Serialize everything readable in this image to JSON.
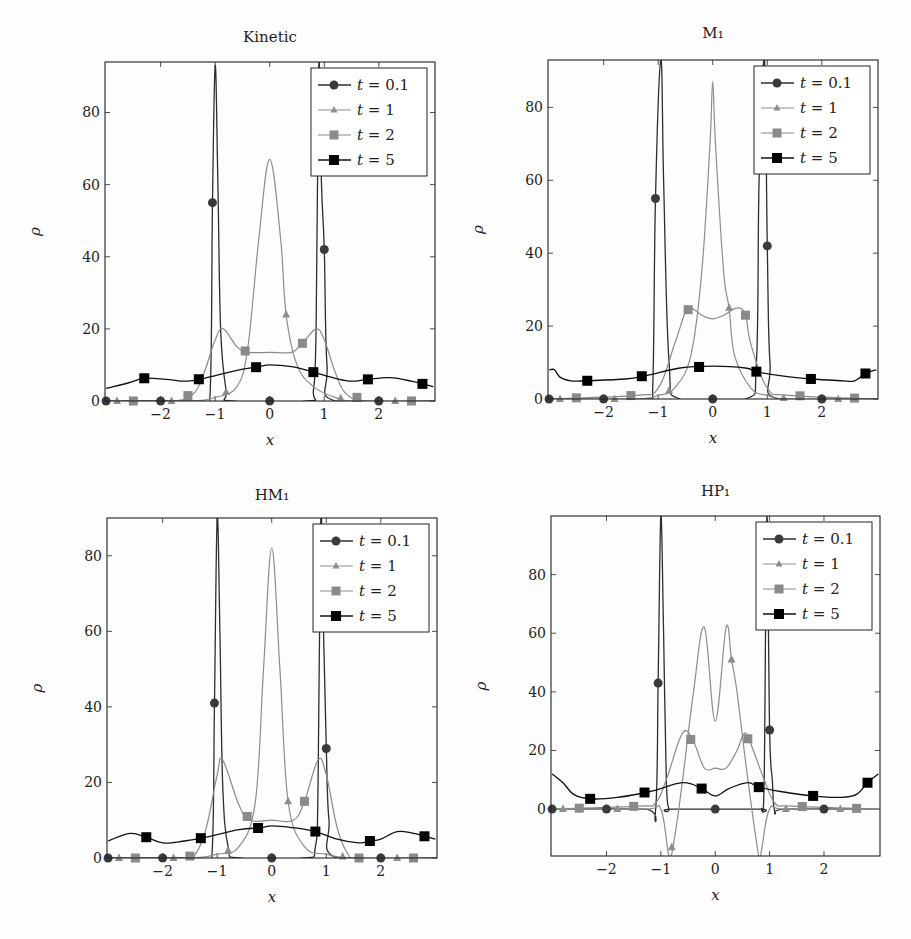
{
  "legend": [
    "t = 0.1",
    "t = 1",
    "t = 2",
    "t = 5"
  ],
  "colors": {
    "t0_1": "#333333",
    "t1": "#8a8a8a",
    "t2": "#888888",
    "t5": "#111111",
    "axis": "#222222"
  },
  "chart_data": [
    {
      "type": "line",
      "title": "Kinetic",
      "xlabel": "x",
      "ylabel": "ρ",
      "xlim": [
        -3,
        3
      ],
      "ylim": [
        0,
        94
      ],
      "xticks": [
        -2,
        -1,
        0,
        1,
        2
      ],
      "yticks": [
        0,
        20,
        40,
        60,
        80
      ],
      "legend_position": "upper right",
      "series": [
        {
          "name": "t = 0.1",
          "marker": "circle",
          "x": [
            -3,
            -1.3,
            -1.1,
            -1.05,
            -1.0,
            -0.95,
            -0.9,
            -0.8,
            -0.7,
            0.7,
            0.8,
            0.85,
            0.9,
            0.95,
            1.0,
            1.05,
            1.2,
            3
          ],
          "y": [
            0,
            0,
            0,
            55,
            93,
            60,
            20,
            3,
            0,
            0,
            3,
            20,
            93,
            60,
            42,
            10,
            0,
            0
          ]
        },
        {
          "name": "t = 1",
          "marker": "triangle",
          "x": [
            -3,
            -1.5,
            -1.0,
            -0.6,
            -0.4,
            -0.2,
            0,
            0.2,
            0.3,
            0.5,
            0.8,
            1.2,
            1.6,
            3
          ],
          "y": [
            0,
            0,
            1,
            4,
            15,
            45,
            67,
            45,
            24,
            10,
            4,
            1,
            0,
            0
          ]
        },
        {
          "name": "t = 2",
          "marker": "square",
          "x": [
            -3,
            -1.8,
            -1.4,
            -1.2,
            -1.0,
            -0.85,
            -0.6,
            -0.4,
            0,
            0.4,
            0.6,
            0.85,
            1.0,
            1.2,
            1.4,
            1.8,
            3
          ],
          "y": [
            0,
            0,
            2,
            8,
            17,
            20,
            15,
            13.5,
            13.5,
            13.5,
            16,
            20,
            17,
            8,
            2,
            0,
            0
          ]
        },
        {
          "name": "t = 5",
          "marker": "square",
          "x": [
            -3,
            -2.6,
            -2.3,
            -1.9,
            -1.5,
            -1.2,
            -0.6,
            -0.2,
            0,
            0.4,
            0.8,
            1.2,
            1.5,
            1.8,
            2.2,
            2.6,
            3
          ],
          "y": [
            3.5,
            5,
            6.3,
            6,
            5.5,
            6.3,
            8.5,
            9.5,
            10,
            9.5,
            8,
            6.3,
            5.5,
            6,
            6.5,
            5.5,
            4
          ]
        }
      ]
    },
    {
      "type": "line",
      "title": "M₁",
      "xlabel": "x",
      "ylabel": "ρ",
      "xlim": [
        -3,
        3
      ],
      "ylim": [
        0,
        93
      ],
      "xticks": [
        -2,
        -1,
        0,
        1,
        2
      ],
      "yticks": [
        0,
        20,
        40,
        60,
        80
      ],
      "legend_position": "upper right",
      "series": [
        {
          "name": "t = 0.1",
          "marker": "circle",
          "x": [
            -3,
            -1.2,
            -1.1,
            -1.05,
            -0.95,
            -0.9,
            -0.8,
            -0.6,
            0.6,
            0.8,
            0.85,
            0.95,
            1.0,
            1.05,
            1.2,
            3
          ],
          "y": [
            0,
            0,
            3,
            55,
            93,
            60,
            10,
            0,
            0,
            10,
            60,
            93,
            42,
            10,
            0,
            0
          ]
        },
        {
          "name": "t = 1",
          "marker": "triangle",
          "x": [
            -3,
            -1.4,
            -1.0,
            -0.7,
            -0.4,
            -0.2,
            -0.05,
            0,
            0.05,
            0.2,
            0.3,
            0.4,
            0.7,
            1.0,
            1.4,
            3
          ],
          "y": [
            0,
            0,
            1,
            3,
            12,
            35,
            70,
            87,
            70,
            35,
            25,
            12,
            3,
            1,
            0,
            0
          ]
        },
        {
          "name": "t = 2",
          "marker": "square",
          "x": [
            -3,
            -1.4,
            -1.0,
            -0.7,
            -0.5,
            -0.4,
            -0.2,
            0,
            0.2,
            0.45,
            0.6,
            0.7,
            1.0,
            1.4,
            3
          ],
          "y": [
            0,
            1,
            3,
            15,
            24,
            25,
            23,
            22,
            23,
            25,
            23,
            15,
            3,
            1,
            0
          ]
        },
        {
          "name": "t = 5",
          "marker": "square",
          "x": [
            -3,
            -2.9,
            -2.8,
            -2.6,
            -2.3,
            -1.6,
            -1.2,
            -0.6,
            0,
            0.6,
            0.8,
            1.2,
            1.8,
            2.4,
            2.6,
            2.8,
            3
          ],
          "y": [
            8,
            8,
            6,
            5,
            5,
            5.5,
            6.5,
            8.5,
            9,
            8.5,
            7.5,
            6.5,
            5.5,
            5,
            5,
            7,
            8
          ]
        }
      ]
    },
    {
      "type": "line",
      "title": "HM₁",
      "xlabel": "x",
      "ylabel": "ρ",
      "xlim": [
        -3,
        3
      ],
      "ylim": [
        0,
        90
      ],
      "xticks": [
        -2,
        -1,
        0,
        1,
        2
      ],
      "yticks": [
        0,
        20,
        40,
        60,
        80
      ],
      "legend_position": "upper right",
      "series": [
        {
          "name": "t = 0.1",
          "marker": "circle",
          "x": [
            -3,
            -1.3,
            -1.1,
            -1.05,
            -1.0,
            -0.95,
            -0.9,
            -0.8,
            -0.6,
            0.6,
            0.8,
            0.85,
            0.9,
            0.95,
            1.0,
            1.05,
            1.2,
            3
          ],
          "y": [
            0,
            0,
            0,
            41,
            90,
            60,
            20,
            3,
            0,
            0,
            3,
            20,
            90,
            60,
            29,
            10,
            0,
            0
          ]
        },
        {
          "name": "t = 1",
          "marker": "triangle",
          "x": [
            -3,
            -1.5,
            -1.0,
            -0.6,
            -0.3,
            -0.15,
            0,
            0.15,
            0.3,
            0.6,
            1.0,
            1.5,
            3
          ],
          "y": [
            0,
            0,
            1,
            3,
            15,
            50,
            82,
            50,
            15,
            3,
            1,
            0,
            0
          ]
        },
        {
          "name": "t = 2",
          "marker": "square",
          "x": [
            -3,
            -1.6,
            -1.4,
            -1.2,
            -1.0,
            -0.9,
            -0.6,
            -0.4,
            0,
            0.4,
            0.6,
            0.85,
            1.0,
            1.2,
            1.4,
            1.6,
            3
          ],
          "y": [
            0,
            0,
            1,
            8,
            22,
            26,
            14,
            10,
            10,
            10,
            15,
            26,
            22,
            8,
            1,
            0,
            0
          ]
        },
        {
          "name": "t = 5",
          "marker": "square",
          "x": [
            -3,
            -2.6,
            -2.3,
            -2.0,
            -1.6,
            -1.2,
            -0.6,
            -0.2,
            0,
            0.4,
            0.8,
            1.2,
            1.6,
            1.8,
            2.0,
            2.3,
            2.6,
            3
          ],
          "y": [
            4.5,
            6.5,
            5.5,
            4,
            4.5,
            5.5,
            7.5,
            8,
            8.5,
            8,
            7,
            5,
            4,
            4.5,
            5,
            7,
            6.5,
            5
          ]
        }
      ]
    },
    {
      "type": "line",
      "title": "HP₁",
      "xlabel": "x",
      "ylabel": "ρ",
      "xlim": [
        -3,
        3
      ],
      "ylim": [
        -16,
        100
      ],
      "xticks": [
        -2,
        -1,
        0,
        1,
        2
      ],
      "yticks": [
        0,
        20,
        40,
        60,
        80
      ],
      "legend_position": "upper right",
      "series": [
        {
          "name": "t = 0.1",
          "marker": "circle",
          "x": [
            -3,
            -1.3,
            -1.1,
            -1.05,
            -1.0,
            -0.95,
            -0.9,
            -0.85,
            -0.8,
            0.8,
            0.85,
            0.9,
            0.95,
            1.0,
            1.05,
            1.1,
            1.3,
            3
          ],
          "y": [
            0,
            0,
            -1,
            43,
            100,
            60,
            10,
            0,
            0,
            0,
            0,
            10,
            100,
            27,
            10,
            -1,
            0,
            0
          ]
        },
        {
          "name": "t = 1",
          "marker": "triangle",
          "x": [
            -3,
            -1.3,
            -1.0,
            -0.85,
            -0.75,
            -0.6,
            -0.4,
            -0.2,
            0,
            0.2,
            0.3,
            0.4,
            0.6,
            0.8,
            0.85,
            1.0,
            1.3,
            3
          ],
          "y": [
            0,
            0,
            0,
            -16,
            -10,
            10,
            40,
            62,
            30,
            62,
            51,
            40,
            10,
            -16,
            -14,
            0,
            0,
            0
          ]
        },
        {
          "name": "t = 2",
          "marker": "square",
          "x": [
            -3,
            -1.4,
            -1.1,
            -0.9,
            -0.6,
            -0.4,
            -0.2,
            0,
            0.2,
            0.4,
            0.55,
            0.7,
            0.9,
            1.1,
            1.4,
            3
          ],
          "y": [
            0,
            1,
            2,
            10,
            26,
            23,
            14,
            14,
            14,
            20,
            26,
            20,
            10,
            2,
            1,
            0
          ]
        },
        {
          "name": "t = 5",
          "marker": "square",
          "x": [
            -3,
            -2.8,
            -2.6,
            -2.3,
            -1.8,
            -1.2,
            -0.6,
            -0.25,
            0,
            0.25,
            0.6,
            0.8,
            1.2,
            1.8,
            2.3,
            2.6,
            2.8,
            3
          ],
          "y": [
            12,
            9,
            5,
            3.5,
            4,
            6,
            9,
            7,
            4.5,
            7,
            9,
            7.5,
            6,
            4.5,
            4,
            5,
            9,
            12
          ]
        }
      ]
    }
  ]
}
